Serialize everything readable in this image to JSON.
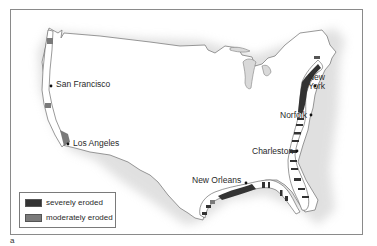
{
  "map": {
    "subject": "Eroding coastlines of the contiguous United States",
    "colors": {
      "severely_eroded": "#333333",
      "moderately_eroded": "#7a7a7a",
      "coast_band": "#ffffff",
      "land_shadow": "#d8d8d8",
      "frame": "#8a8a8a"
    },
    "cities": [
      {
        "name": "San Francisco",
        "x": 48,
        "y": 84
      },
      {
        "name": "Los Angeles",
        "x": 68,
        "y": 145
      },
      {
        "name": "New York",
        "x": 311,
        "y": 80
      },
      {
        "name": "Norfolk",
        "x": 311,
        "y": 114
      },
      {
        "name": "Charleston",
        "x": 296,
        "y": 150
      },
      {
        "name": "New Orleans",
        "x": 245,
        "y": 182
      }
    ],
    "legend": {
      "items": [
        {
          "label": "severely eroded",
          "color": "#333333"
        },
        {
          "label": "moderately eroded",
          "color": "#7a7a7a"
        }
      ]
    },
    "panel_letter": "a"
  }
}
